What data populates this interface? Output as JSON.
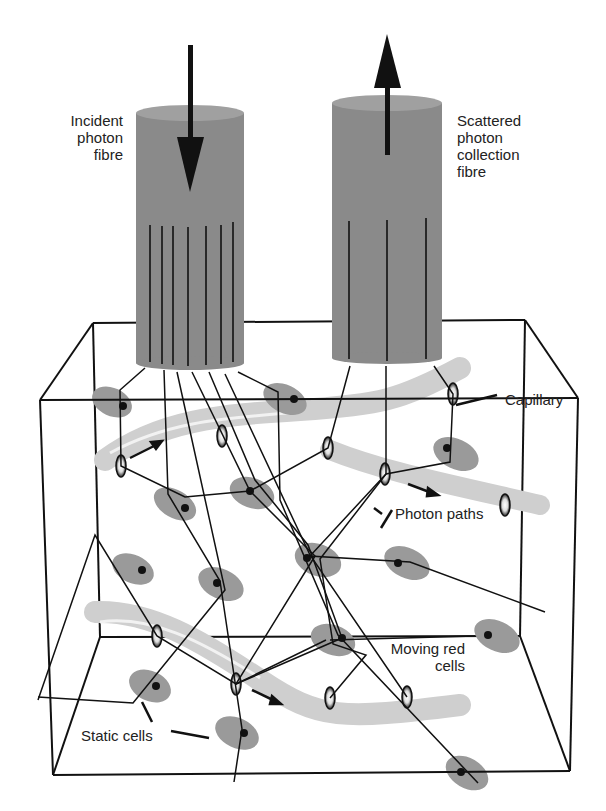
{
  "diagram": {
    "type": "schematic",
    "labels": {
      "incident_fibre": [
        "Incident",
        "photon",
        "fibre"
      ],
      "collection_fibre": [
        "Scattered",
        "photon",
        "collection",
        "fibre"
      ],
      "capillary": "Capillary",
      "photon_paths": "Photon paths",
      "moving_red_cells": [
        "Moving red",
        "cells"
      ],
      "static_cells": "Static cells"
    },
    "colors": {
      "fibre": "#8a8a8a",
      "fibre_top": "#a0a0a0",
      "capillary": "#d4d4d4",
      "cell": "#9a9a9a",
      "line": "#111111"
    },
    "arrows": {
      "incident": "down",
      "collection": "up"
    }
  }
}
